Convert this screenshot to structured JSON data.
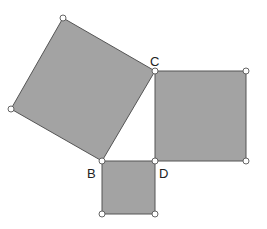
{
  "diagram": {
    "title": "",
    "colors": {
      "fill": "#a3a3a3",
      "stroke": "#555555",
      "background": "#ffffff"
    },
    "labels": {
      "C": "C",
      "B": "B",
      "D": "D"
    },
    "squares": [
      {
        "name": "square-on-BC",
        "points": "63,18 155,71 102,161 11,109"
      },
      {
        "name": "square-on-CD",
        "points": "155,71 246,71 246,161 155,161"
      },
      {
        "name": "square-on-BD",
        "points": "102,161 155,161 155,214 102,214"
      }
    ]
  }
}
